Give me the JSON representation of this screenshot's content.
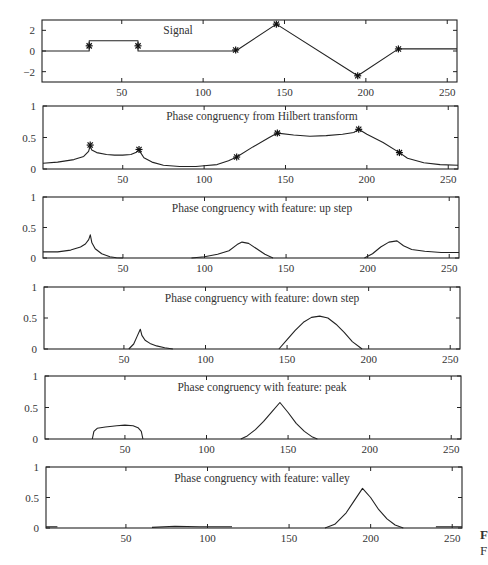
{
  "figure": {
    "caption_fragments": [
      "F",
      "F"
    ]
  },
  "chart_data": [
    {
      "type": "line",
      "title": "Signal",
      "xlim": [
        1,
        256
      ],
      "ylim": [
        -3,
        3
      ],
      "xticks": [
        50,
        100,
        150,
        200,
        250
      ],
      "yticks": [
        -2,
        0,
        2
      ],
      "ytick_labels": [
        "−2",
        "0",
        "2"
      ],
      "x": [
        1,
        30,
        30,
        60,
        60,
        120,
        145,
        195,
        220,
        256
      ],
      "y": [
        0,
        0,
        1,
        1,
        0,
        0,
        2.6,
        -2.4,
        0.2,
        0.2
      ],
      "markers": {
        "x": [
          30,
          60,
          120,
          145,
          195,
          220
        ],
        "y": [
          0.5,
          0.5,
          0.1,
          2.6,
          -2.4,
          0.2
        ]
      }
    },
    {
      "type": "line",
      "title": "Phase congruency from Hilbert transform",
      "xlim": [
        1,
        256
      ],
      "ylim": [
        0,
        1
      ],
      "xticks": [
        50,
        100,
        150,
        200,
        250
      ],
      "yticks": [
        0,
        0.5,
        1
      ],
      "ytick_labels": [
        "0",
        "0.5",
        "1"
      ],
      "x": [
        1,
        10,
        20,
        26,
        29,
        30,
        31,
        34,
        40,
        45,
        50,
        55,
        58,
        60,
        61,
        63,
        68,
        75,
        85,
        95,
        100,
        108,
        115,
        120,
        130,
        140,
        145,
        155,
        165,
        175,
        185,
        192,
        195,
        200,
        210,
        220,
        225,
        235,
        245,
        256
      ],
      "y": [
        0.09,
        0.11,
        0.15,
        0.2,
        0.28,
        0.37,
        0.3,
        0.26,
        0.23,
        0.22,
        0.22,
        0.23,
        0.26,
        0.3,
        0.26,
        0.18,
        0.11,
        0.06,
        0.04,
        0.04,
        0.05,
        0.07,
        0.13,
        0.19,
        0.35,
        0.5,
        0.57,
        0.54,
        0.52,
        0.53,
        0.55,
        0.58,
        0.63,
        0.55,
        0.42,
        0.26,
        0.17,
        0.1,
        0.07,
        0.06
      ],
      "markers": {
        "x": [
          30,
          60,
          120,
          145,
          195,
          220
        ],
        "y": [
          0.38,
          0.31,
          0.19,
          0.57,
          0.63,
          0.26
        ]
      }
    },
    {
      "type": "line",
      "title": "Phase congruency with feature: up step",
      "xlim": [
        1,
        256
      ],
      "ylim": [
        0,
        1
      ],
      "xticks": [
        50,
        100,
        150,
        200,
        250
      ],
      "yticks": [
        0,
        0.5,
        1
      ],
      "ytick_labels": [
        "0",
        "0.5",
        "1"
      ],
      "segments": [
        {
          "x": [
            1,
            10,
            18,
            24,
            27,
            29,
            30,
            31,
            33,
            37,
            42,
            46,
            50
          ],
          "y": [
            0.1,
            0.1,
            0.13,
            0.18,
            0.23,
            0.3,
            0.38,
            0.25,
            0.15,
            0.07,
            0.02,
            0.005,
            0
          ]
        },
        {
          "x": [
            92,
            100,
            108,
            115,
            120,
            123,
            127,
            132,
            137,
            142
          ],
          "y": [
            0,
            0.02,
            0.06,
            0.12,
            0.22,
            0.26,
            0.24,
            0.15,
            0.06,
            0
          ]
        },
        {
          "x": [
            198,
            203,
            208,
            213,
            218,
            222,
            227,
            235,
            245,
            256
          ],
          "y": [
            0,
            0.07,
            0.18,
            0.26,
            0.28,
            0.2,
            0.14,
            0.11,
            0.09,
            0.09
          ]
        }
      ]
    },
    {
      "type": "line",
      "title": "Phase congruency with feature: down step",
      "xlim": [
        1,
        256
      ],
      "ylim": [
        0,
        1
      ],
      "xticks": [
        50,
        100,
        150,
        200,
        250
      ],
      "yticks": [
        0,
        0.5,
        1
      ],
      "ytick_labels": [
        "0",
        "0.5",
        "1"
      ],
      "segments": [
        {
          "x": [
            53,
            56,
            58,
            60,
            61,
            63,
            66,
            70,
            75,
            80
          ],
          "y": [
            0,
            0.08,
            0.2,
            0.32,
            0.22,
            0.14,
            0.09,
            0.05,
            0.02,
            0
          ]
        },
        {
          "x": [
            145,
            150,
            155,
            160,
            165,
            170,
            175,
            180,
            185,
            190,
            196
          ],
          "y": [
            0,
            0.15,
            0.3,
            0.43,
            0.51,
            0.53,
            0.5,
            0.4,
            0.27,
            0.12,
            0
          ]
        }
      ]
    },
    {
      "type": "line",
      "title": "Phase congruency with feature: peak",
      "xlim": [
        1,
        256
      ],
      "ylim": [
        0,
        1
      ],
      "xticks": [
        50,
        100,
        150,
        200,
        250
      ],
      "yticks": [
        0,
        0.5,
        1
      ],
      "ytick_labels": [
        "0",
        "0.5",
        "1"
      ],
      "segments": [
        {
          "x": [
            30,
            31,
            33,
            38,
            45,
            50,
            55,
            58,
            60,
            61
          ],
          "y": [
            0,
            0.12,
            0.17,
            0.19,
            0.21,
            0.22,
            0.21,
            0.18,
            0.12,
            0
          ]
        },
        {
          "x": [
            121,
            125,
            130,
            135,
            140,
            145,
            150,
            155,
            160,
            165,
            168
          ],
          "y": [
            0,
            0.05,
            0.15,
            0.28,
            0.43,
            0.58,
            0.42,
            0.25,
            0.12,
            0.03,
            0
          ]
        }
      ]
    },
    {
      "type": "line",
      "title": "Phase congruency with feature: valley",
      "xlim": [
        1,
        256
      ],
      "ylim": [
        0,
        1
      ],
      "xticks": [
        50,
        100,
        150,
        200,
        250
      ],
      "yticks": [
        0,
        0.5,
        1
      ],
      "ytick_labels": [
        "0",
        "0.5",
        "1"
      ],
      "segments": [
        {
          "x": [
            1,
            8
          ],
          "y": [
            0.02,
            0.02
          ]
        },
        {
          "x": [
            66,
            80,
            95,
            115
          ],
          "y": [
            0.01,
            0.03,
            0.02,
            0.02
          ]
        },
        {
          "x": [
            172,
            178,
            185,
            190,
            195,
            200,
            205,
            210,
            215,
            220
          ],
          "y": [
            0,
            0.06,
            0.25,
            0.45,
            0.65,
            0.5,
            0.3,
            0.15,
            0.05,
            0
          ]
        },
        {
          "x": [
            240,
            256
          ],
          "y": [
            0.02,
            0.02
          ]
        }
      ]
    }
  ]
}
